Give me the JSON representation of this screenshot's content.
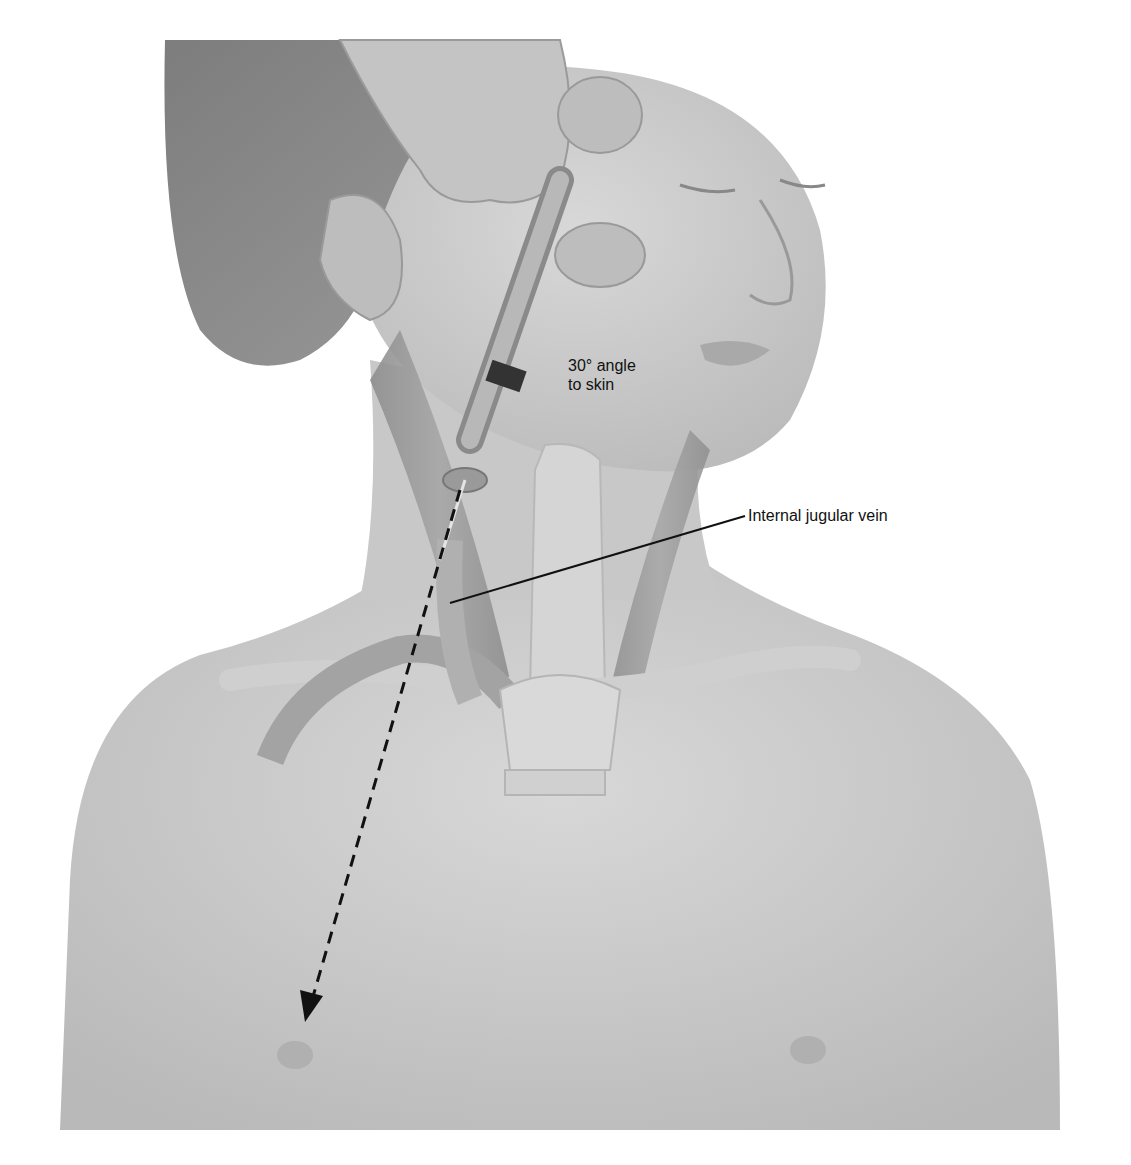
{
  "figure": {
    "type": "medical illustration",
    "labels": {
      "angle_line1": "30° angle",
      "angle_line2": "to skin",
      "vessel": "Internal jugular vein"
    },
    "colors": {
      "background": "#ffffff",
      "skin": "#cfcfcf",
      "skin_shadow": "#b2b2b2",
      "hair": "#8a8a8a",
      "muscle": "#9a9a9a",
      "vessel": "#bdbdbd",
      "text": "#111111",
      "arrow": "#111111"
    }
  }
}
